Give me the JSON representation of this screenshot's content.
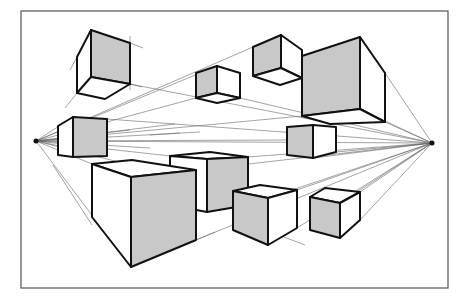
{
  "figure": {
    "vanishing_points": [
      "left",
      "right"
    ],
    "shade_color": "#c8c8c8",
    "line_color": "#111111",
    "guide_color": "#666666",
    "cube_count": 10
  }
}
